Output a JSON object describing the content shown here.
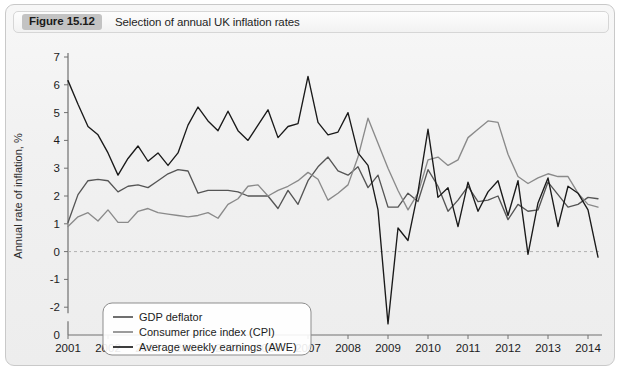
{
  "figure": {
    "badge": "Figure 15.12",
    "caption": "Selection of annual UK inflation rates"
  },
  "chart_data": {
    "type": "line",
    "title": "Selection of annual UK inflation rates",
    "xlabel": "",
    "ylabel": "Annual rate of inflation, %",
    "xlim": [
      2001.0,
      2014.35
    ],
    "ylim": [
      -3.0,
      7.0
    ],
    "yticks": [
      7,
      6,
      5,
      4,
      3,
      2,
      1,
      0,
      -1,
      -2
    ],
    "ytick_labels": [
      "7",
      "6",
      "5",
      "4",
      "3",
      "2",
      "1",
      "0",
      "-1",
      "-2"
    ],
    "axis_break_label": "0",
    "xticks": [
      2001,
      2002,
      2003,
      2004,
      2005,
      2006,
      2007,
      2008,
      2009,
      2010,
      2011,
      2012,
      2013,
      2014
    ],
    "xtick_labels": [
      "2001",
      "2002",
      "2003",
      "2004",
      "2005",
      "2006",
      "2007",
      "2008",
      "2009",
      "2010",
      "2011",
      "2012",
      "2013",
      "2014"
    ],
    "grid": false,
    "zero_line": true,
    "zero_line_style": "dashed",
    "legend_position": "lower-left",
    "colors": {
      "gdp_deflator": "#555555",
      "cpi": "#8a8a8a",
      "awe": "#1a1a1a",
      "zero_line": "#b0b0b0",
      "axis": "#707070"
    },
    "x": [
      2001.0,
      2001.25,
      2001.5,
      2001.75,
      2002.0,
      2002.25,
      2002.5,
      2002.75,
      2003.0,
      2003.25,
      2003.5,
      2003.75,
      2004.0,
      2004.25,
      2004.5,
      2004.75,
      2005.0,
      2005.25,
      2005.5,
      2005.75,
      2006.0,
      2006.25,
      2006.5,
      2006.75,
      2007.0,
      2007.25,
      2007.5,
      2007.75,
      2008.0,
      2008.25,
      2008.5,
      2008.75,
      2009.0,
      2009.25,
      2009.5,
      2009.75,
      2010.0,
      2010.25,
      2010.5,
      2010.75,
      2011.0,
      2011.25,
      2011.5,
      2011.75,
      2012.0,
      2012.25,
      2012.5,
      2012.75,
      2013.0,
      2013.25,
      2013.5,
      2013.75,
      2014.0,
      2014.25
    ],
    "series": [
      {
        "name": "GDP deflator",
        "color": "#555555",
        "values": [
          1.05,
          2.05,
          2.55,
          2.6,
          2.55,
          2.15,
          2.35,
          2.4,
          2.3,
          2.55,
          2.8,
          2.95,
          2.9,
          2.1,
          2.2,
          2.2,
          2.2,
          2.15,
          2.0,
          2.0,
          2.0,
          1.55,
          2.2,
          1.7,
          2.55,
          3.05,
          3.4,
          2.9,
          2.75,
          3.05,
          2.3,
          2.75,
          1.6,
          1.6,
          2.1,
          1.8,
          2.95,
          2.35,
          1.45,
          1.85,
          2.35,
          1.8,
          1.85,
          2.0,
          1.15,
          1.7,
          1.45,
          1.5,
          2.5,
          2.05,
          1.6,
          1.7,
          1.95,
          1.9
        ]
      },
      {
        "name": "Consumer price index (CPI)",
        "color": "#8a8a8a",
        "values": [
          0.9,
          1.25,
          1.4,
          1.1,
          1.5,
          1.05,
          1.05,
          1.45,
          1.55,
          1.4,
          1.35,
          1.3,
          1.25,
          1.3,
          1.4,
          1.2,
          1.7,
          1.9,
          2.35,
          2.4,
          2.0,
          2.2,
          2.35,
          2.55,
          2.85,
          2.6,
          1.85,
          2.1,
          2.4,
          3.4,
          4.8,
          3.9,
          3.0,
          2.2,
          1.5,
          2.1,
          3.3,
          3.4,
          3.1,
          3.3,
          4.1,
          4.4,
          4.7,
          4.65,
          3.5,
          2.7,
          2.45,
          2.65,
          2.8,
          2.7,
          2.7,
          2.1,
          1.7,
          1.6
        ]
      },
      {
        "name": "Average weekly earnings (AWE)",
        "color": "#1a1a1a",
        "values": [
          6.15,
          5.3,
          4.5,
          4.2,
          3.55,
          2.75,
          3.35,
          3.8,
          3.25,
          3.55,
          3.1,
          3.55,
          4.55,
          5.2,
          4.7,
          4.35,
          5.05,
          4.35,
          4.0,
          4.55,
          5.1,
          4.1,
          4.5,
          4.6,
          6.3,
          4.65,
          4.2,
          4.3,
          5.0,
          3.55,
          3.1,
          1.5,
          -2.6,
          0.85,
          0.4,
          2.15,
          4.4,
          1.95,
          2.3,
          0.9,
          2.5,
          1.45,
          2.15,
          2.55,
          1.3,
          2.55,
          -0.1,
          1.75,
          2.65,
          0.9,
          2.35,
          2.1,
          1.5,
          -0.2
        ]
      }
    ]
  },
  "legend": {
    "items": [
      {
        "label": "GDP deflator",
        "color": "#555555"
      },
      {
        "label": "Consumer price index (CPI)",
        "color": "#8a8a8a"
      },
      {
        "label": "Average weekly earnings (AWE)",
        "color": "#1a1a1a"
      }
    ]
  }
}
